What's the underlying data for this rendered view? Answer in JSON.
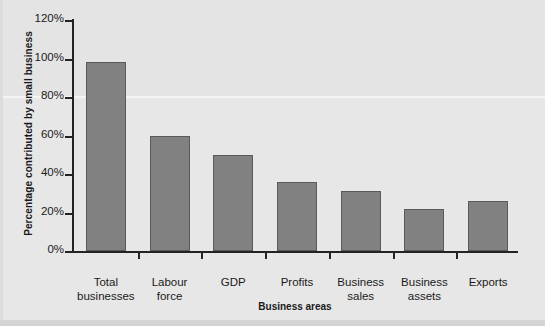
{
  "chart_data": {
    "type": "bar",
    "title": "",
    "xlabel": "Business areas",
    "ylabel": "Percentage contributed by small business",
    "categories": [
      "Total\nbusinesses",
      "Labour\nforce",
      "GDP",
      "Profits",
      "Business\nsales",
      "Business\nassets",
      "Exports"
    ],
    "values": [
      98,
      60,
      50,
      36,
      31,
      22,
      26
    ],
    "ylim": [
      0,
      120
    ],
    "ytick_labels": [
      "0%",
      "20%",
      "40%",
      "60%",
      "80%",
      "100%",
      "120%"
    ],
    "ytick_values": [
      0,
      20,
      40,
      60,
      80,
      100,
      120
    ],
    "grid": false,
    "legend": false,
    "bar_color": "#818181",
    "bar_edge_color": "#5a5a5a",
    "axis_color": "#232323",
    "background_color": "#e6e6e6"
  }
}
